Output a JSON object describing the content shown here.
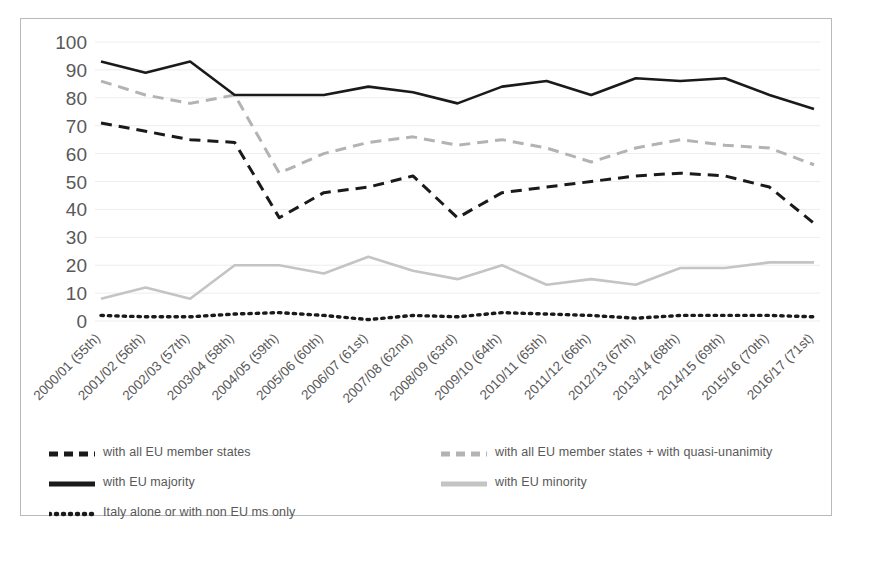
{
  "chart_data": {
    "type": "line",
    "title": "",
    "xlabel": "",
    "ylabel": "",
    "ylim": [
      0,
      100
    ],
    "yticks": [
      0,
      10,
      20,
      30,
      40,
      50,
      60,
      70,
      80,
      90,
      100
    ],
    "grid": true,
    "legend_position": "bottom",
    "categories": [
      "2000/01 (55th)",
      "2001/02 (56th)",
      "2002/03 (57th)",
      "2003/04 (58th)",
      "2004/05 (59th)",
      "2005/06 (60th)",
      "2006/07 (61st)",
      "2007/08 (62nd)",
      "2008/09 (63rd)",
      "2009/10 (64th)",
      "2010/11 (65th)",
      "2011/12 (66th)",
      "2012/13 (67th)",
      "2013/14 (68th)",
      "2014/15 (69th)",
      "2015/16 (70th)",
      "2016/17 (71st)"
    ],
    "series": [
      {
        "name": "with all EU member states",
        "style": "dashed",
        "color": "#1a1a1a",
        "values": [
          71,
          68,
          65,
          64,
          37,
          46,
          48,
          52,
          37,
          46,
          48,
          50,
          52,
          53,
          52,
          48,
          35
        ]
      },
      {
        "name": "with all EU member states + with quasi-unanimity",
        "style": "dashed",
        "color": "#b3b3b3",
        "values": [
          86,
          81,
          78,
          81,
          53,
          60,
          64,
          66,
          63,
          65,
          62,
          57,
          62,
          65,
          63,
          62,
          56
        ]
      },
      {
        "name": "with EU majority",
        "style": "solid",
        "color": "#1a1a1a",
        "values": [
          93,
          89,
          93,
          81,
          81,
          81,
          84,
          82,
          78,
          84,
          86,
          81,
          87,
          86,
          87,
          81,
          76
        ]
      },
      {
        "name": "with EU minority",
        "style": "solid",
        "color": "#c4c4c4",
        "values": [
          8,
          12,
          8,
          20,
          20,
          17,
          23,
          18,
          15,
          20,
          13,
          15,
          13,
          19,
          19,
          21,
          21
        ]
      },
      {
        "name": "Italy alone or with non EU ms only",
        "style": "dotted",
        "color": "#1a1a1a",
        "values": [
          2,
          1.5,
          1.5,
          2.5,
          3,
          2,
          0.5,
          2,
          1.5,
          3,
          2.5,
          2,
          1,
          2,
          2,
          2,
          1.5
        ]
      }
    ]
  },
  "axis": {
    "y_tick_labels": [
      "100",
      "90",
      "80",
      "70",
      "60",
      "50",
      "40",
      "30",
      "20",
      "10",
      "0"
    ],
    "x_tick_labels": [
      "2000/01 (55th)",
      "2001/02 (56th)",
      "2002/03 (57th)",
      "2003/04 (58th)",
      "2004/05 (59th)",
      "2005/06 (60th)",
      "2006/07 (61st)",
      "2007/08 (62nd)",
      "2008/09 (63rd)",
      "2009/10 (64th)",
      "2010/11 (65th)",
      "2011/12 (66th)",
      "2012/13 (67th)",
      "2013/14 (68th)",
      "2014/15 (69th)",
      "2015/16 (70th)",
      "2016/17 (71st)"
    ]
  },
  "legend": {
    "left_column": [
      {
        "label": "with all EU member states",
        "style": "dashed",
        "color": "#1a1a1a"
      },
      {
        "label": "with EU majority",
        "style": "solid",
        "color": "#1a1a1a"
      },
      {
        "label": "Italy alone or with non EU ms only",
        "style": "dotted",
        "color": "#1a1a1a"
      }
    ],
    "right_column": [
      {
        "label": "with all EU member states + with quasi-unanimity",
        "style": "dashed",
        "color": "#b3b3b3"
      },
      {
        "label": "with EU minority",
        "style": "solid",
        "color": "#c4c4c4"
      }
    ]
  },
  "colors": {
    "border": "#b9b9b9",
    "grid": "#ededed",
    "tick_text": "#595959",
    "dark_series": "#1a1a1a",
    "light_dashed_series": "#b3b3b3",
    "light_solid_series": "#c4c4c4"
  }
}
